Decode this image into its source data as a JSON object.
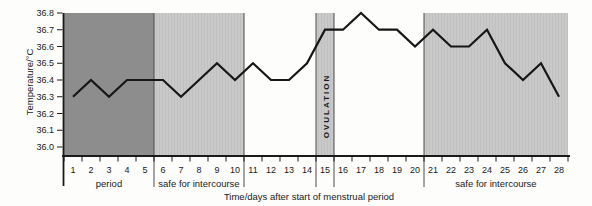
{
  "chart_data": {
    "type": "line",
    "title": "",
    "xlabel": "Time/days after start of menstrual period",
    "ylabel": "Temperature/°C",
    "days": [
      1,
      2,
      3,
      4,
      5,
      6,
      7,
      8,
      9,
      10,
      11,
      12,
      13,
      14,
      15,
      16,
      17,
      18,
      19,
      20,
      21,
      22,
      23,
      24,
      25,
      26,
      27,
      28
    ],
    "values": [
      36.3,
      36.4,
      36.3,
      36.4,
      36.4,
      36.4,
      36.3,
      36.4,
      36.5,
      36.4,
      36.5,
      36.4,
      36.4,
      36.5,
      36.7,
      36.7,
      36.8,
      36.7,
      36.7,
      36.6,
      36.7,
      36.6,
      36.6,
      36.7,
      36.5,
      36.4,
      36.5,
      36.3
    ],
    "ylim": [
      36.0,
      36.8
    ],
    "ytick_labels": [
      "36.0",
      "36.1",
      "36.2",
      "36.3",
      "36.4",
      "36.5",
      "36.6",
      "36.7",
      "36.8"
    ],
    "grid": false,
    "legend": "none",
    "line_color": "#161616",
    "axis_color": "#1a1a1a",
    "divider_color": "#4d4d4d",
    "text_color": "#1a1a1a",
    "bands": [
      {
        "name": "period",
        "label": "period",
        "day_start": 1,
        "day_end": 5,
        "color": "#8d8d8d",
        "texture": "solid",
        "label_placement": "below-axis"
      },
      {
        "name": "safe-1",
        "label": "safe for intercourse",
        "day_start": 6,
        "day_end": 10,
        "color": "#c9c9c9",
        "texture": "striped",
        "label_placement": "below-axis"
      },
      {
        "name": "ovulation",
        "label": "OVULATION",
        "day_start": 15,
        "day_end": 15,
        "color": "#c9c9c9",
        "texture": "striped",
        "label_placement": "inside-vertical"
      },
      {
        "name": "safe-2",
        "label": "safe for intercourse",
        "day_start": 21,
        "day_end": 28,
        "color": "#c9c9c9",
        "texture": "striped",
        "label_placement": "below-axis"
      }
    ]
  }
}
